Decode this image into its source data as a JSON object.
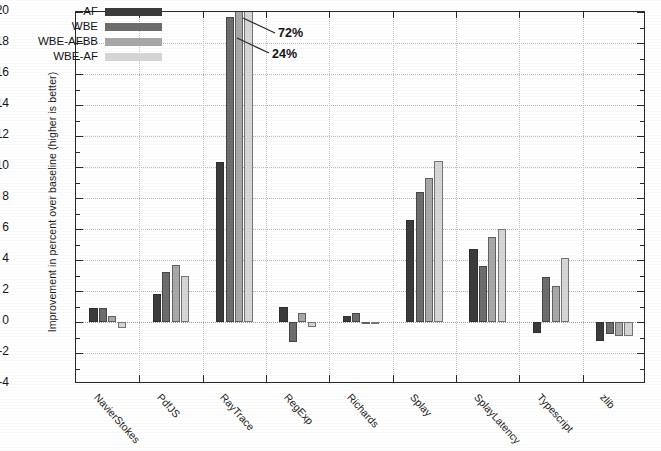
{
  "chart_data": {
    "type": "bar",
    "title": "",
    "xlabel": "",
    "ylabel": "Improvement in percent over baseline (higher is better)",
    "ylim": [
      -4,
      20
    ],
    "ytick_step": 2,
    "yticks": [
      -4,
      -2,
      0,
      2,
      4,
      6,
      8,
      10,
      12,
      14,
      16,
      18,
      20
    ],
    "grid": true,
    "legend_position": "top-left-inside",
    "categories": [
      "NavierStokes",
      "PdfJS",
      "RayTrace",
      "RegExp",
      "Richards",
      "Splay",
      "SplayLatency",
      "Typescript",
      "zlib"
    ],
    "series": [
      {
        "name": "AF",
        "color": "#3b3b3b",
        "values": [
          0.9,
          1.8,
          10.3,
          1.0,
          0.4,
          6.6,
          4.7,
          -0.7,
          -1.2
        ]
      },
      {
        "name": "WBE",
        "color": "#6d6d6d",
        "values": [
          0.9,
          3.2,
          19.7,
          -1.3,
          0.6,
          8.4,
          3.6,
          2.9,
          -0.8
        ]
      },
      {
        "name": "WBE-AFBB",
        "color": "#a8a8a8",
        "values": [
          0.4,
          3.7,
          72.0,
          0.6,
          -0.15,
          9.3,
          5.5,
          2.3,
          -0.9
        ]
      },
      {
        "name": "WBE-AF",
        "color": "#d6d6d6",
        "values": [
          -0.4,
          3.0,
          24.0,
          -0.3,
          0.0,
          10.4,
          6.0,
          4.1,
          -0.9
        ]
      }
    ],
    "clipped_bars": [
      {
        "category": "RayTrace",
        "series": "WBE-AFBB",
        "label": "72%"
      },
      {
        "category": "RayTrace",
        "series": "WBE-AF",
        "label": "24%"
      }
    ],
    "annotations": [
      {
        "text": "72%",
        "points_to": "RayTrace / WBE-AFBB"
      },
      {
        "text": "24%",
        "points_to": "RayTrace / WBE-AF"
      }
    ]
  },
  "legend": {
    "items": [
      {
        "label": "AF",
        "color": "#3b3b3b"
      },
      {
        "label": "WBE",
        "color": "#6d6d6d"
      },
      {
        "label": "WBE-AFBB",
        "color": "#a8a8a8"
      },
      {
        "label": "WBE-AF",
        "color": "#d6d6d6"
      }
    ]
  },
  "axis": {
    "y_title": "Improvement in percent over baseline (higher is better)",
    "y_tick_labels": [
      "20",
      "18",
      "16",
      "14",
      "12",
      "10",
      "8",
      "6",
      "4",
      "2",
      "0",
      "-2",
      "-4"
    ],
    "x_tick_labels": [
      "NavierStokes",
      "PdfJS",
      "RayTrace",
      "RegExp",
      "Richards",
      "Splay",
      "SplayLatency",
      "Typescript",
      "zlib"
    ]
  },
  "annotations": {
    "a1": "72%",
    "a2": "24%"
  }
}
